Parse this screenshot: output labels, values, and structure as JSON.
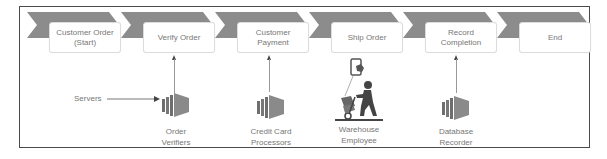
{
  "diagram": {
    "title": "",
    "stages": [
      {
        "label_line1": "Customer Order",
        "label_line2": "(Start)"
      },
      {
        "label_line1": "Verify Order",
        "label_line2": ""
      },
      {
        "label_line1": "Customer",
        "label_line2": "Payment"
      },
      {
        "label_line1": "Ship Order",
        "label_line2": ""
      },
      {
        "label_line1": "Record",
        "label_line2": "Completion"
      },
      {
        "label_line1": "End",
        "label_line2": ""
      }
    ],
    "actors": [
      {
        "icon": "server-stack-icon",
        "line1": "Order",
        "line2": "Verifiers",
        "stage": "Verify Order"
      },
      {
        "icon": "server-stack-icon",
        "line1": "Credit Card",
        "line2": "Processors",
        "stage": "Customer Payment"
      },
      {
        "icon": "warehouse-worker-with-phone-icon",
        "line1": "Warehouse",
        "line2": "Employee",
        "stage": "Ship Order"
      },
      {
        "icon": "server-stack-icon",
        "line1": "Database",
        "line2": "Recorder",
        "stage": "Record Completion"
      }
    ],
    "input": {
      "label": "Servers",
      "target": "Order Verifiers"
    },
    "colors": {
      "chevron": "#8c8c8c",
      "frame": "#4a4a4a",
      "text": "#777777",
      "icon": "#6e6e6e"
    }
  }
}
